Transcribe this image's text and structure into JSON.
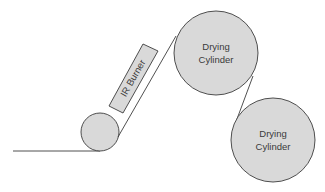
{
  "diagram": {
    "title": "",
    "colors": {
      "fill": "#d9d9d9",
      "stroke": "#3c3c3c",
      "text": "#3a3a3a",
      "background": "#ffffff"
    },
    "components": {
      "ir_burner": {
        "label": "IR Burner"
      },
      "drying_cylinder_1": {
        "label_line1": "Drying",
        "label_line2": "Cylinder"
      },
      "drying_cylinder_2": {
        "label_line1": "Drying",
        "label_line2": "Cylinder"
      },
      "guide_roller": {
        "label": ""
      }
    },
    "web_path": [
      "baseline",
      "guide roller",
      "IR burner zone",
      "drying cylinder 1",
      "drying cylinder 2"
    ]
  }
}
